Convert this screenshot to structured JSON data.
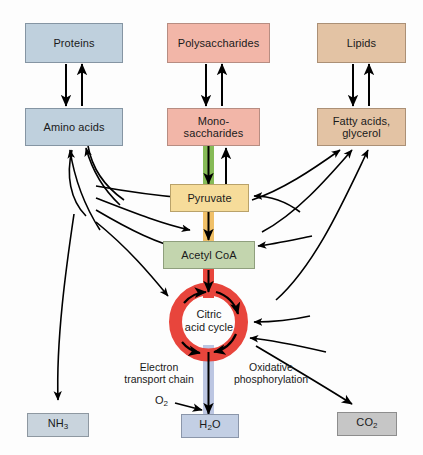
{
  "diagram": {
    "colors": {
      "protein": "#bfd0dd",
      "carbohydrate": "#f2b6a8",
      "lipid": "#e3c3a4",
      "pyruvate": "#f6dc9a",
      "acetyl_coa": "#c3d5ae",
      "citric_acid_cycle": "#e8453c",
      "glycolysis_band": "#86bb57",
      "pyruvate_band": "#f0c068",
      "etc_band": "#bcc6e2",
      "arrow": "#000000",
      "background": "#fdfdfd"
    }
  },
  "nodes": {
    "proteins": {
      "label": "Proteins"
    },
    "amino_acids": {
      "label": "Amino acids"
    },
    "polysaccharides": {
      "label": "Polysaccharides"
    },
    "monosaccharides": {
      "label_line1": "Mono-",
      "label_line2": "saccharides"
    },
    "lipids": {
      "label": "Lipids"
    },
    "fatty_acids": {
      "label_line1": "Fatty acids,",
      "label_line2": "glycerol"
    },
    "pyruvate": {
      "label": "Pyruvate"
    },
    "acetyl_coa": {
      "label": "Acetyl CoA"
    },
    "citric_acid_cycle": {
      "label_line1": "Citric",
      "label_line2": "acid cycle"
    },
    "ammonia": {
      "label": "NH",
      "subscript": "3"
    },
    "water": {
      "label": "H",
      "subscript": "2",
      "label_tail": "O"
    },
    "carbon_dioxide": {
      "label": "CO",
      "subscript": "2"
    },
    "oxygen": {
      "label": "O",
      "subscript": "2"
    }
  },
  "pathway_labels": {
    "electron_transport_chain": {
      "line1": "Electron",
      "line2": "transport chain"
    },
    "oxidative_phosphorylation": {
      "line1": "Oxidative",
      "line2": "phosphorylation"
    }
  }
}
